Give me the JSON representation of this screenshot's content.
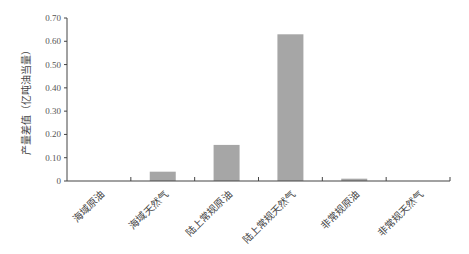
{
  "chart_data": {
    "type": "bar",
    "title": "",
    "xlabel": "",
    "ylabel": "产量差值（亿吨油当量）",
    "categories": [
      "海域原油",
      "海域天然气",
      "陆上常规原油",
      "陆上常规天然气",
      "非常规原油",
      "非常规天然气"
    ],
    "values": [
      0.0,
      0.04,
      0.155,
      0.63,
      0.01,
      0.0
    ],
    "ylim": [
      0,
      0.7
    ],
    "yticks": [
      "0",
      "0.10",
      "0.20",
      "0.30",
      "0.40",
      "0.50",
      "0.60",
      "0.70"
    ],
    "grid": false,
    "legend": null,
    "bar_color": "#a6a6a6"
  }
}
